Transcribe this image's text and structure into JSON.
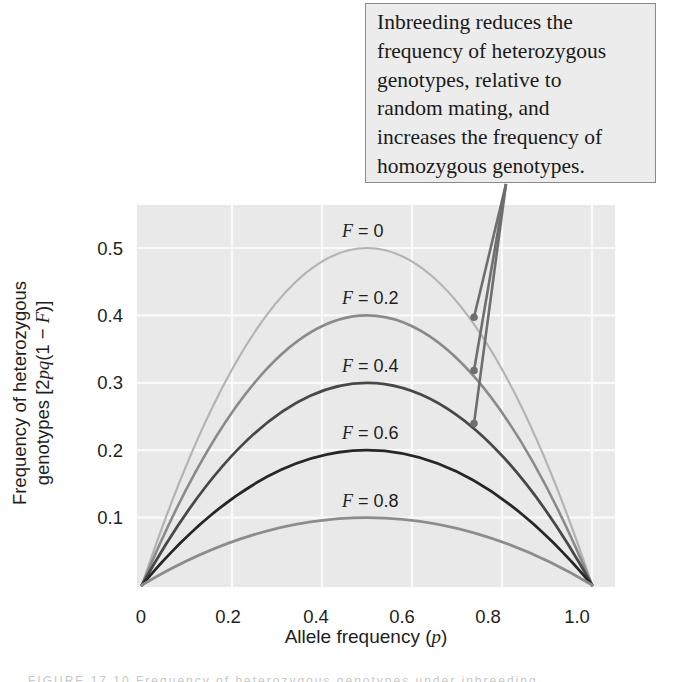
{
  "callout": {
    "lines": [
      "Inbreeding reduces the",
      "frequency of heterozygous",
      "genotypes, relative to",
      "random mating, and",
      "increases the frequency of",
      "homozygous genotypes."
    ],
    "pointer_targets": [
      "F = 0",
      "F = 0.2",
      "F = 0.4"
    ]
  },
  "axes": {
    "xlabel_text": "Allele frequency (",
    "xlabel_var": "p",
    "xlabel_close": ")",
    "ylabel_line1": "Frequency of heterozygous",
    "ylabel_line2_prefix": "genotypes [2",
    "ylabel_line2_var": "pq",
    "ylabel_line2_mid": "(1 − ",
    "ylabel_line2_F": "F",
    "ylabel_line2_suffix": ")]"
  },
  "caption": {
    "text": "FIGURE 17.10  Frequency of heterozygous genotypes under inbreeding"
  },
  "chart_data": {
    "type": "line",
    "title": "",
    "xlabel": "Allele frequency (p)",
    "ylabel": "Frequency of heterozygous genotypes [2pq(1 − F)]",
    "xlim": [
      0,
      1
    ],
    "ylim": [
      0,
      0.5
    ],
    "x_ticks": [
      "0",
      "0.2",
      "0.4",
      "0.6",
      "0.8",
      "1.0"
    ],
    "y_ticks": [
      "0.1",
      "0.2",
      "0.3",
      "0.4",
      "0.5"
    ],
    "grid": true,
    "legend": "inline labels above each curve peak",
    "formula": "2pq(1 - F)",
    "x": [
      0,
      0.1,
      0.2,
      0.3,
      0.4,
      0.5,
      0.6,
      0.7,
      0.8,
      0.9,
      1.0
    ],
    "series": [
      {
        "name": "F = 0",
        "F": 0.0,
        "label_prefix": "F",
        "label_value": " = 0",
        "color": "#b3b3b3",
        "width": 2.2,
        "values": [
          0,
          0.18,
          0.32,
          0.42,
          0.48,
          0.5,
          0.48,
          0.42,
          0.32,
          0.18,
          0
        ]
      },
      {
        "name": "F = 0.2",
        "F": 0.2,
        "label_prefix": "F",
        "label_value": " = 0.2",
        "color": "#8a8a8a",
        "width": 2.6,
        "values": [
          0,
          0.144,
          0.256,
          0.336,
          0.384,
          0.4,
          0.384,
          0.336,
          0.256,
          0.144,
          0
        ]
      },
      {
        "name": "F = 0.4",
        "F": 0.4,
        "label_prefix": "F",
        "label_value": " = 0.4",
        "color": "#484848",
        "width": 2.8,
        "values": [
          0,
          0.108,
          0.192,
          0.252,
          0.288,
          0.3,
          0.288,
          0.252,
          0.192,
          0.108,
          0
        ]
      },
      {
        "name": "F = 0.6",
        "F": 0.6,
        "label_prefix": "F",
        "label_value": " = 0.6",
        "color": "#262626",
        "width": 2.8,
        "values": [
          0,
          0.072,
          0.128,
          0.168,
          0.192,
          0.2,
          0.192,
          0.168,
          0.128,
          0.072,
          0
        ]
      },
      {
        "name": "F = 0.8",
        "F": 0.8,
        "label_prefix": "F",
        "label_value": " = 0.8",
        "color": "#8c8c8c",
        "width": 2.8,
        "values": [
          0,
          0.036,
          0.064,
          0.084,
          0.096,
          0.1,
          0.096,
          0.084,
          0.064,
          0.036,
          0
        ]
      }
    ],
    "annotation_points": [
      {
        "series": "F = 0",
        "p": 0.73
      },
      {
        "series": "F = 0.2",
        "p": 0.73
      },
      {
        "series": "F = 0.4",
        "p": 0.73
      }
    ],
    "colors": {
      "plot_background": "#e9e9e9",
      "gridline": "#fafafa",
      "pointer": "#6e6e6e",
      "callout_fill": "#ececec",
      "callout_border": "#8a8a8a"
    }
  }
}
